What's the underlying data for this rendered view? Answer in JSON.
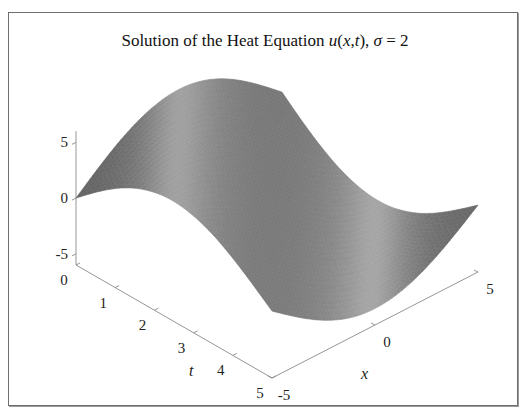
{
  "chart_data": {
    "type": "surface",
    "title": {
      "prefix": "Solution of the Heat Equation ",
      "func": "u",
      "args": "(x,t)",
      "sep": ", ",
      "param_symbol": "σ",
      "param_eq": " = 2"
    },
    "xlabel": "x",
    "ylabel": "t",
    "zlabel": "",
    "xlim": [
      -5,
      5
    ],
    "tlim": [
      0,
      5
    ],
    "zlim": [
      -6,
      6
    ],
    "x_ticks": [
      {
        "v": -5,
        "label": "-5"
      },
      {
        "v": 0,
        "label": "0"
      },
      {
        "v": 5,
        "label": "5"
      }
    ],
    "t_ticks": [
      {
        "v": 0,
        "label": "0"
      },
      {
        "v": 1,
        "label": "1"
      },
      {
        "v": 2,
        "label": "2"
      },
      {
        "v": 3,
        "label": "3"
      },
      {
        "v": 4,
        "label": "4"
      },
      {
        "v": 5,
        "label": "5"
      }
    ],
    "z_ticks": [
      {
        "v": 5,
        "label": "5"
      },
      {
        "v": 0,
        "label": "0"
      },
      {
        "v": -5,
        "label": "-5"
      }
    ],
    "sigma": 2,
    "surface_model": "u(x,t) = 5*sin(pi*(x+5)/10 + pi*t/5) * exp(-0.02*t)",
    "colormap": "gray",
    "shading": "interp-lit",
    "grid": false
  }
}
